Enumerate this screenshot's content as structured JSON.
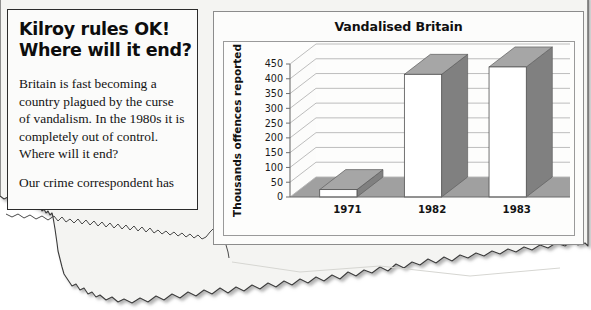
{
  "article": {
    "headline_lines": [
      "Kilroy rules OK!",
      "Where will it end?"
    ],
    "paragraphs": [
      "Britain is fast becoming a country plagued by the curse of vandalism. In the 1980s it is completely out of control. Where will it end?",
      "Our crime correspondent has"
    ]
  },
  "chart_panel": {
    "title": "Vandalised Britain"
  },
  "chart_data": {
    "type": "bar",
    "title": "Vandalised Britain",
    "categories": [
      "1971",
      "1982",
      "1983"
    ],
    "values": [
      25,
      415,
      440
    ],
    "xlabel": "",
    "ylabel": "Thousands offences reported",
    "ylim": [
      0,
      450
    ],
    "ytick_step": 50,
    "yticks": [
      0,
      50,
      100,
      150,
      200,
      250,
      300,
      350,
      400,
      450
    ],
    "grid": true,
    "legend": "none",
    "style": "3d-column",
    "colors": {
      "bar_front": "#ffffff",
      "bar_side": "#808080",
      "bar_top": "#a6a6a6",
      "floor": "#a0a0a0",
      "back_wall": "#fdfdfc",
      "gridline": "#b5b5b5",
      "axis": "#6d6d6d"
    }
  },
  "page": {
    "paper_color": "#f4f4f2",
    "background": "#ffffff"
  }
}
